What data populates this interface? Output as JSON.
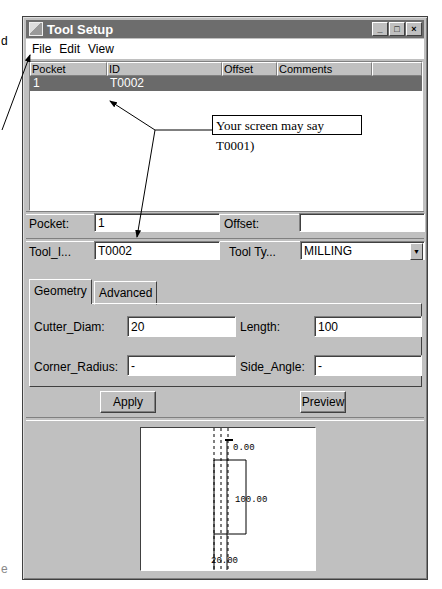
{
  "window": {
    "title": "Tool Setup",
    "controls": {
      "minimize": "_",
      "maximize": "□",
      "close": "×"
    }
  },
  "menubar": {
    "items": [
      "File",
      "Edit",
      "View"
    ]
  },
  "tool_list": {
    "columns": [
      "Pocket",
      "ID",
      "Offset",
      "Comments",
      ""
    ],
    "rows": [
      {
        "pocket": "1",
        "id": "T0002",
        "offset": "",
        "comments": "",
        "selected": true
      }
    ]
  },
  "form": {
    "pocket_label": "Pocket:",
    "pocket_value": "1",
    "offset_label": "Offset:",
    "offset_value": "",
    "tool_id_label": "Tool_I...",
    "tool_id_value": "T0002",
    "tool_type_label": "Tool Ty...",
    "tool_type_value": "MILLING"
  },
  "tabs": [
    {
      "label": "Geometry",
      "active": true
    },
    {
      "label": "Advanced",
      "active": false
    }
  ],
  "geometry": {
    "cutter_diam_label": "Cutter_Diam:",
    "cutter_diam_value": "20",
    "length_label": "Length:",
    "length_value": "100",
    "corner_radius_label": "Corner_Radius:",
    "corner_radius_value": "-",
    "side_angle_label": "Side_Angle:",
    "side_angle_value": "-"
  },
  "buttons": {
    "apply": "Apply",
    "preview": "Preview"
  },
  "preview_drawing": {
    "top_label": "0.00",
    "length_label": "100.00",
    "diam_label": "20.00"
  },
  "annotation": {
    "callout_text": "Your screen may say T0001)",
    "side_letter_top": "d",
    "side_letter_bottom": "e"
  }
}
